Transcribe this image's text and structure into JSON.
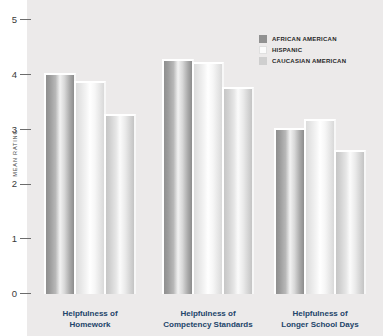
{
  "chart_data": {
    "type": "bar",
    "title": "",
    "xlabel": "",
    "ylabel": "MEAN RATING",
    "ylim": [
      0,
      5
    ],
    "yticks": [
      "0",
      "1",
      "2",
      "3",
      "4",
      "5"
    ],
    "grid": false,
    "legend_position": "top-right",
    "categories": [
      "Helpfulness of\nHomework",
      "Helpfulness of\nCompetency Standards",
      "Helpfulness of\nLonger School Days"
    ],
    "category_lines": [
      [
        "Helpfulness of",
        "Homework"
      ],
      [
        "Helpfulness of",
        "Competency Standards"
      ],
      [
        "Helpfulness of",
        "Longer School Days"
      ]
    ],
    "series": [
      {
        "name": "AFRICAN AMERICAN",
        "values": [
          4.0,
          4.25,
          3.0
        ]
      },
      {
        "name": "HISPANIC",
        "values": [
          3.85,
          4.2,
          3.15
        ]
      },
      {
        "name": "CAUCASIAN AMERICAN",
        "values": [
          3.25,
          3.75,
          2.6
        ]
      }
    ]
  },
  "legend": {
    "items": [
      {
        "label": "AFRICAN AMERICAN",
        "color": "#919191"
      },
      {
        "label": "HISPANIC",
        "color": "#fbfbfb"
      },
      {
        "label": "CAUCASIAN AMERICAN",
        "color": "#cfcfcf"
      }
    ]
  },
  "axis": {
    "y_label": "MEAN RATING",
    "y_ticks": [
      "5",
      "4",
      "3",
      "2",
      "1",
      "0"
    ]
  }
}
